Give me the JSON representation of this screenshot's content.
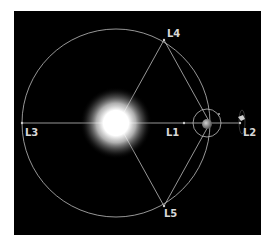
{
  "diagram": {
    "colors": {
      "background": "#000000",
      "lines": "#bdbdbd",
      "label": "#d8d8d8",
      "sun": "#ffffff"
    },
    "labels": {
      "l1": "L1",
      "l2": "L2",
      "l3": "L3",
      "l4": "L4",
      "l5": "L5"
    },
    "bodies": [
      "sun",
      "earth",
      "moon",
      "spacecraft-at-L2"
    ]
  }
}
